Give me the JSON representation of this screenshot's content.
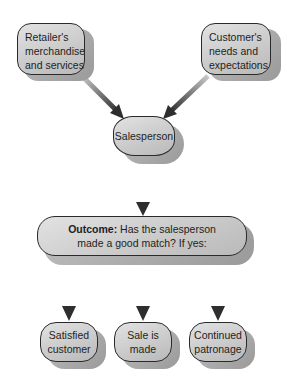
{
  "diagram": {
    "type": "flowchart",
    "colors": {
      "node_fill_light": "#e2e2e2",
      "node_fill_dark": "#b9b9b9",
      "node_border": "#2a2a2a",
      "shadow": "#a8a8a8",
      "arrow": "#3a3a3a",
      "background": "#ffffff"
    },
    "nodes": {
      "retailer": {
        "line1": "Retailer's",
        "line2": "merchandise",
        "line3": "and services"
      },
      "customer": {
        "line1": "Customer's",
        "line2": "needs and",
        "line3": "expectations"
      },
      "salesperson": {
        "label": "Salesperson"
      },
      "outcome": {
        "label_bold": "Outcome:",
        "line1_rest": " Has the salesperson",
        "line2": "made a good match?  If yes:"
      },
      "satisfied": {
        "line1": "Satisfied",
        "line2": "customer"
      },
      "sale": {
        "line1": "Sale is",
        "line2": "made"
      },
      "patronage": {
        "line1": "Continued",
        "line2": "patronage"
      }
    },
    "edges": [
      {
        "from": "retailer",
        "to": "salesperson"
      },
      {
        "from": "customer",
        "to": "salesperson"
      },
      {
        "from": "salesperson",
        "to": "outcome"
      },
      {
        "from": "outcome",
        "to": "satisfied"
      },
      {
        "from": "outcome",
        "to": "sale"
      },
      {
        "from": "outcome",
        "to": "patronage"
      }
    ]
  }
}
